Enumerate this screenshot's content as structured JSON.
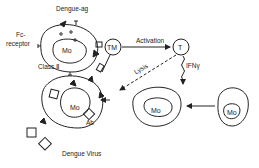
{
  "diagram": {
    "labels": {
      "dengue_ag": "Dengue-ag",
      "fc_receptor_line1": "Fc-",
      "fc_receptor_line2": "receptor",
      "class_ii": "Class Ⅱ",
      "mo_top": "Mo",
      "tm": "TM",
      "activation": "Activation",
      "t_cell": "T",
      "lysis": "Lysis",
      "ifn": "IFNγ",
      "mo_infected": "Mo",
      "ab": "Ab",
      "dengue_virus": "Dengue Virus",
      "mo_activated": "Mo",
      "mo_resting": "Mo"
    },
    "colors": {
      "stroke": "#222222",
      "background": "#ffffff"
    }
  }
}
